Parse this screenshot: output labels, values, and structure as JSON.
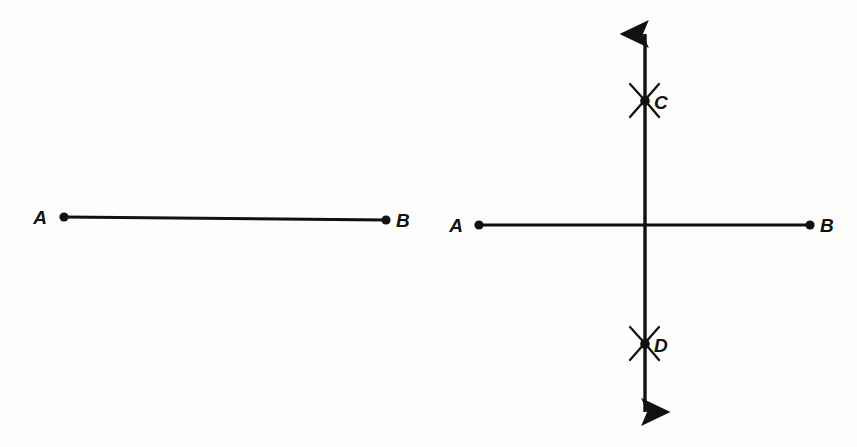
{
  "figure": {
    "background_color": "#fdfdfb",
    "ink_color": "#111111",
    "panels": [
      {
        "id": "panel-left",
        "caption": "Given segment AB",
        "labels": {
          "a": "A",
          "b": "B"
        },
        "segment": {
          "x1": 64,
          "y1": 217,
          "x2": 386,
          "y2": 220
        },
        "label_positions": {
          "a": {
            "x": 40,
            "y": 224
          },
          "b": {
            "x": 396,
            "y": 227
          }
        }
      },
      {
        "id": "panel-right",
        "caption": "Segment AB with perpendicular bisector through C and D",
        "labels": {
          "a": "A",
          "b": "B",
          "c": "C",
          "d": "D"
        },
        "segment": {
          "x1": 479,
          "y1": 225,
          "x2": 810,
          "y2": 225
        },
        "bisector": {
          "x": 645,
          "y_top": 26,
          "y_bottom": 420,
          "arrow_both_ends": true
        },
        "arc_marks": [
          {
            "name": "C",
            "x": 645,
            "y": 101
          },
          {
            "name": "D",
            "x": 645,
            "y": 344
          }
        ],
        "label_positions": {
          "a": {
            "x": 456,
            "y": 232
          },
          "b": {
            "x": 820,
            "y": 232
          },
          "c": {
            "x": 654,
            "y": 109
          },
          "d": {
            "x": 654,
            "y": 352
          }
        }
      }
    ]
  }
}
